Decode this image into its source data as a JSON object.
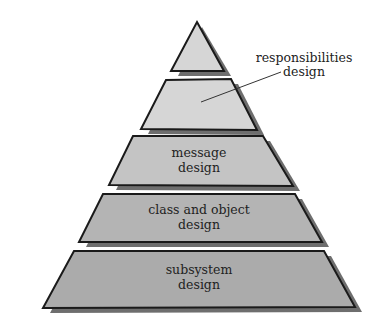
{
  "diagram": {
    "type": "pyramid",
    "title": "",
    "layers": [
      {
        "id": "top",
        "lines": []
      },
      {
        "id": "responsibilities",
        "lines": [
          "responsibilities",
          "design"
        ],
        "callout": true
      },
      {
        "id": "message",
        "lines": [
          "message",
          "design"
        ]
      },
      {
        "id": "class-object",
        "lines": [
          "class and object",
          "design"
        ]
      },
      {
        "id": "subsystem",
        "lines": [
          "subsystem",
          "design"
        ]
      }
    ],
    "colors": {
      "light_fill": "#d6d6d6",
      "dark_fill": "#ababab",
      "shadow": "#6e6e6e",
      "stroke": "#1a1a1a"
    }
  }
}
